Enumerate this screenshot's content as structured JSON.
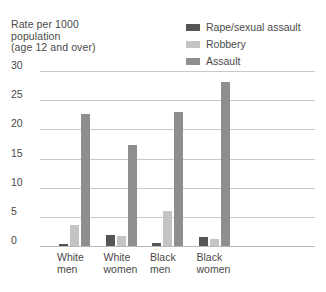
{
  "axis_title": "Rate per 1000\npopulation\n(age 12 and over)",
  "legend": {
    "items": [
      {
        "label": "Rape/sexual assault",
        "color": "#555555",
        "key": "rape"
      },
      {
        "label": "Robbery",
        "color": "#c4c4c4",
        "key": "robbery"
      },
      {
        "label": "Assault",
        "color": "#8e8e8e",
        "key": "assault"
      }
    ]
  },
  "yaxis": {
    "ticks": [
      "30",
      "25",
      "20",
      "15",
      "10",
      "5",
      "0"
    ],
    "min": 0,
    "max": 30,
    "step": 5
  },
  "categories": [
    {
      "label": "White\nmen"
    },
    {
      "label": "White\nwomen"
    },
    {
      "label": "Black\nmen"
    },
    {
      "label": "Black\nwomen"
    }
  ],
  "chart_data": {
    "type": "bar",
    "title": "",
    "subtitle": "",
    "xlabel": "",
    "ylabel": "Rate per 1000 population (age 12 and over)",
    "categories": [
      "White men",
      "White women",
      "Black men",
      "Black women"
    ],
    "series": [
      {
        "name": "Rape/sexual assault",
        "color": "#555555",
        "values": [
          0.3,
          1.9,
          0.5,
          1.6
        ]
      },
      {
        "name": "Robbery",
        "color": "#c4c4c4",
        "values": [
          3.6,
          1.8,
          6.0,
          1.2
        ]
      },
      {
        "name": "Assault",
        "color": "#8e8e8e",
        "values": [
          22.7,
          17.4,
          22.9,
          28.2
        ]
      }
    ],
    "ylim": [
      0,
      30
    ],
    "ytick_step": 5,
    "grid": true,
    "legend_position": "top-right"
  }
}
